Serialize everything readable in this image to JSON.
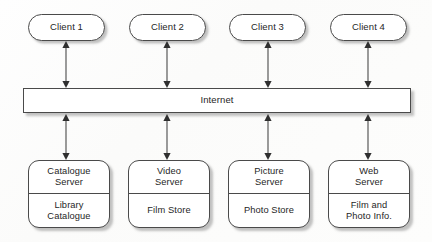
{
  "diagram": {
    "colors": {
      "stroke": "#4a4a4a",
      "text": "#262626",
      "fill": "#ffffff",
      "shadow": "rgba(120,120,120,0.45)",
      "background": "#ffffff"
    },
    "clients": [
      {
        "label": "Client 1",
        "x": 28,
        "y": 14
      },
      {
        "label": "Client 2",
        "x": 129,
        "y": 14
      },
      {
        "label": "Client 3",
        "x": 229,
        "y": 14
      },
      {
        "label": "Client 4",
        "x": 330,
        "y": 14
      }
    ],
    "backbone": {
      "label": "Internet"
    },
    "servers": [
      {
        "top_label": "Catalogue\nServer",
        "bottom_label": "Library\nCatalogue",
        "x": 28
      },
      {
        "top_label": "Video\nServer",
        "bottom_label": "Film Store",
        "x": 128
      },
      {
        "top_label": "Picture\nServer",
        "bottom_label": "Photo Store",
        "x": 228
      },
      {
        "top_label": "Web\nServer",
        "bottom_label": "Film and\nPhoto Info.",
        "x": 328
      }
    ],
    "connectors": {
      "style": "double-headed-arrow",
      "upper": [
        {
          "from": "Client 1",
          "to": "Internet",
          "x": 66
        },
        {
          "from": "Client 2",
          "to": "Internet",
          "x": 167
        },
        {
          "from": "Client 3",
          "to": "Internet",
          "x": 268
        },
        {
          "from": "Client 4",
          "to": "Internet",
          "x": 368
        }
      ],
      "lower": [
        {
          "from": "Internet",
          "to": "Catalogue Server",
          "x": 66
        },
        {
          "from": "Internet",
          "to": "Video Server",
          "x": 167
        },
        {
          "from": "Internet",
          "to": "Picture Server",
          "x": 268
        },
        {
          "from": "Internet",
          "to": "Web Server",
          "x": 368
        }
      ]
    }
  }
}
